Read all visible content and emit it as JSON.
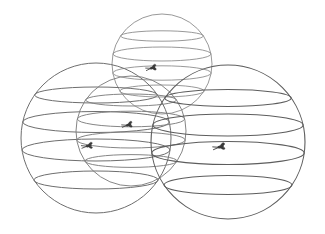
{
  "figure": {
    "background_color": "#ffffff",
    "canvas": {
      "width": 325,
      "height": 234
    },
    "line_color_dark": "#585858",
    "line_color_light": "#9a9a9a",
    "creature_color": "#3a3a3a",
    "creature_count": 4,
    "sphere_count": 4
  },
  "spheres": [
    {
      "id": "sphere-top",
      "label": "top sphere",
      "cx": 162,
      "cy": 64,
      "r": 50,
      "stroke": "#8d8d8d",
      "stroke_width": 0.9,
      "latitudes": [
        {
          "offset": -28,
          "ry": 5.2
        },
        {
          "offset": -10,
          "ry": 7.0
        },
        {
          "offset": 9,
          "ry": 7.2
        },
        {
          "offset": 27,
          "ry": 6.0
        }
      ]
    },
    {
      "id": "sphere-left",
      "label": "left sphere",
      "cx": 96,
      "cy": 138,
      "r": 75,
      "stroke": "#6e6e6e",
      "stroke_width": 1.0,
      "latitudes": [
        {
          "offset": -43,
          "ry": 8.0
        },
        {
          "offset": -16,
          "ry": 10.5
        },
        {
          "offset": 12,
          "ry": 11.0
        },
        {
          "offset": 42,
          "ry": 9.0
        }
      ]
    },
    {
      "id": "sphere-middle",
      "label": "middle front sphere",
      "cx": 131,
      "cy": 131,
      "r": 55,
      "stroke": "#7e7e7e",
      "stroke_width": 0.95,
      "latitudes": [
        {
          "offset": -31,
          "ry": 6.0
        },
        {
          "offset": -12,
          "ry": 7.8
        },
        {
          "offset": 9,
          "ry": 8.0
        },
        {
          "offset": 30,
          "ry": 6.4
        }
      ]
    },
    {
      "id": "sphere-right",
      "label": "right sphere",
      "cx": 228,
      "cy": 142,
      "r": 77,
      "stroke": "#5d5d5d",
      "stroke_width": 1.1,
      "latitudes": [
        {
          "offset": -44,
          "ry": 8.5
        },
        {
          "offset": -17,
          "ry": 11.0
        },
        {
          "offset": 11,
          "ry": 11.5
        },
        {
          "offset": 43,
          "ry": 9.5
        }
      ]
    }
  ],
  "creatures": [
    {
      "id": "creature-top",
      "label": "creature in top sphere",
      "x": 152,
      "y": 68,
      "scale": 1.0,
      "rotation": -12
    },
    {
      "id": "creature-middle",
      "label": "creature in middle sphere",
      "x": 128,
      "y": 125,
      "scale": 1.0,
      "rotation": -10
    },
    {
      "id": "creature-left",
      "label": "creature in left sphere",
      "x": 88,
      "y": 146,
      "scale": 1.05,
      "rotation": -8
    },
    {
      "id": "creature-right",
      "label": "creature in right sphere",
      "x": 220,
      "y": 147,
      "scale": 1.15,
      "rotation": -10
    }
  ]
}
